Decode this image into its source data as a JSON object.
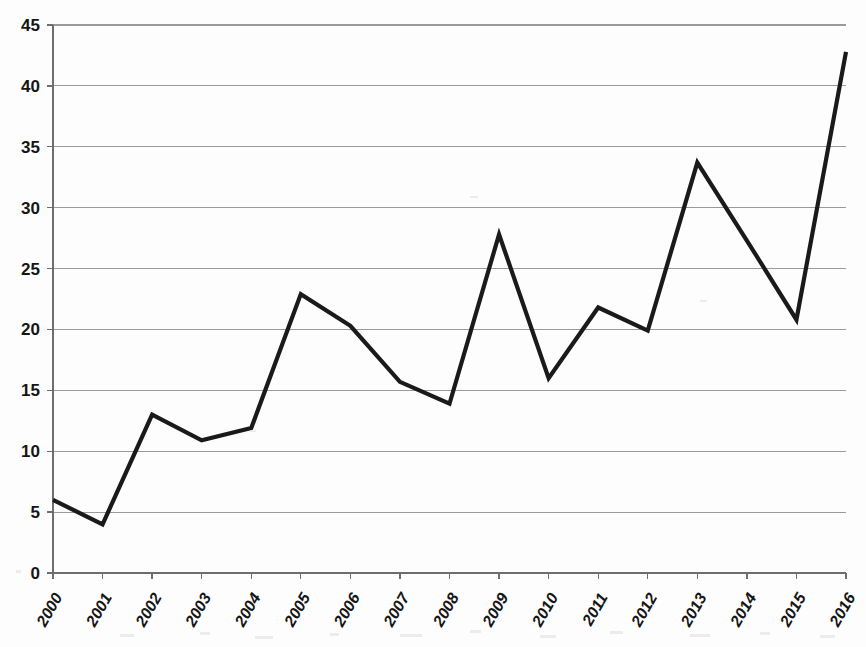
{
  "chart_data": {
    "type": "line",
    "title": "",
    "subtitle": "",
    "xlabel": "",
    "ylabel": "",
    "categories": [
      "2000",
      "2001",
      "2002",
      "2003",
      "2004",
      "2005",
      "2006",
      "2007",
      "2008",
      "2009",
      "2010",
      "2011",
      "2012",
      "2013",
      "2014",
      "2015",
      "2016"
    ],
    "values": [
      6.0,
      4.0,
      13.0,
      10.9,
      11.9,
      22.9,
      20.3,
      15.7,
      13.9,
      27.8,
      16.0,
      21.8,
      19.9,
      33.7,
      27.3,
      20.8,
      42.8
    ],
    "series": [
      {
        "name": "",
        "values": [
          6.0,
          4.0,
          13.0,
          10.9,
          11.9,
          22.9,
          20.3,
          15.7,
          13.9,
          27.8,
          16.0,
          21.8,
          19.9,
          33.7,
          27.3,
          20.8,
          42.8
        ]
      }
    ],
    "ylim": [
      0,
      45
    ],
    "xlim": [
      "2000",
      "2016"
    ],
    "y_ticks": [
      0,
      5,
      10,
      15,
      20,
      25,
      30,
      35,
      40,
      45
    ],
    "y_tick_labels": [
      "0",
      "5",
      "10",
      "15",
      "20",
      "25",
      "30",
      "35",
      "40",
      "45"
    ],
    "x_ticks": [
      "2000",
      "2001",
      "2002",
      "2003",
      "2004",
      "2005",
      "2006",
      "2007",
      "2008",
      "2009",
      "2010",
      "2011",
      "2012",
      "2013",
      "2014",
      "2015",
      "2016"
    ],
    "grid": true,
    "grid_axis": "y",
    "legend": false,
    "legend_position": "none",
    "annotations": [],
    "colors": {
      "line": "#1a1a1a",
      "grid": "#9a9a9a",
      "axis": "#6e6e6e",
      "background": "#fdfdfd",
      "tick_text": "#151515"
    },
    "x_tick_label_rotation": -60
  }
}
